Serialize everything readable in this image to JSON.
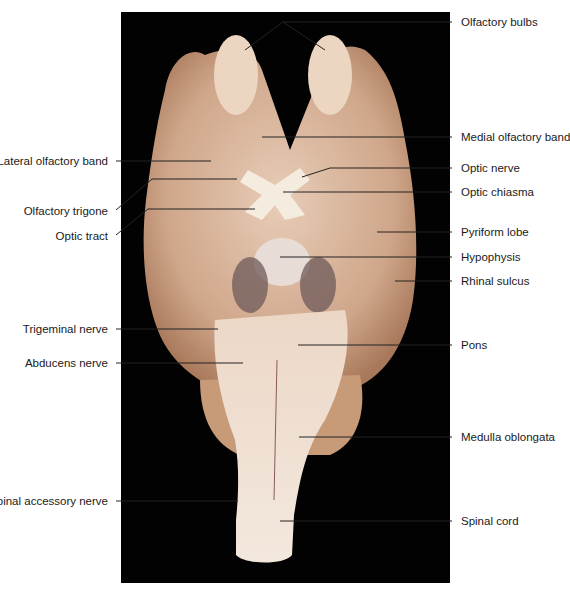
{
  "figure": {
    "photo_background": "#020202",
    "tissue_color": "#d9b9a0"
  },
  "labels": {
    "left": [
      {
        "id": "lateral-olfactory-band",
        "text": "Lateral olfactory band"
      },
      {
        "id": "olfactory-trigone",
        "text": "Olfactory trigone"
      },
      {
        "id": "optic-tract",
        "text": "Optic tract"
      },
      {
        "id": "trigeminal-nerve",
        "text": "Trigeminal nerve"
      },
      {
        "id": "abducens-nerve",
        "text": "Abducens nerve"
      },
      {
        "id": "spinal-accessory-nerve",
        "text": "Spinal accessory nerve"
      }
    ],
    "right": [
      {
        "id": "olfactory-bulbs",
        "text": "Olfactory bulbs"
      },
      {
        "id": "medial-olfactory-band",
        "text": "Medial olfactory band"
      },
      {
        "id": "optic-nerve",
        "text": "Optic nerve"
      },
      {
        "id": "optic-chiasma",
        "text": "Optic chiasma"
      },
      {
        "id": "pyriform-lobe",
        "text": "Pyriform lobe"
      },
      {
        "id": "hypophysis",
        "text": "Hypophysis"
      },
      {
        "id": "rhinal-sulcus",
        "text": "Rhinal sulcus"
      },
      {
        "id": "pons",
        "text": "Pons"
      },
      {
        "id": "medulla-oblongata",
        "text": "Medulla oblongata"
      },
      {
        "id": "spinal-cord",
        "text": "Spinal cord"
      }
    ]
  }
}
